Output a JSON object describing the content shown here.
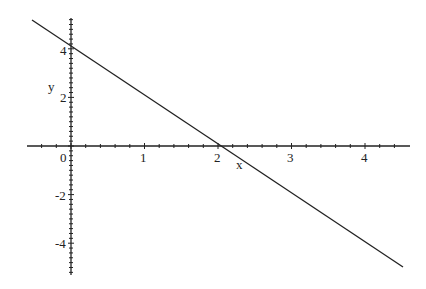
{
  "chart_data": {
    "type": "line",
    "title": "",
    "xlabel": "x",
    "ylabel": "y",
    "xlim": [
      -0.55,
      4.5
    ],
    "ylim": [
      -5.2,
      5.2
    ],
    "x_ticks": [
      "0",
      "1",
      "2",
      "3",
      "4"
    ],
    "y_ticks": [
      "4",
      "2",
      "-2",
      "-4"
    ],
    "grid": false,
    "legend": null,
    "series": [
      {
        "name": "y = -2x + 4",
        "x": [
          -0.53,
          4.5
        ],
        "y": [
          5.06,
          -5.0
        ]
      }
    ]
  },
  "labels": {
    "x_axis": "x",
    "y_axis": "y",
    "xt0": "0",
    "xt1": "1",
    "xt2": "2",
    "xt3": "3",
    "xt4": "4",
    "yt4": "4",
    "yt2": "2",
    "ytm2": "-2",
    "ytm4": "-4"
  }
}
